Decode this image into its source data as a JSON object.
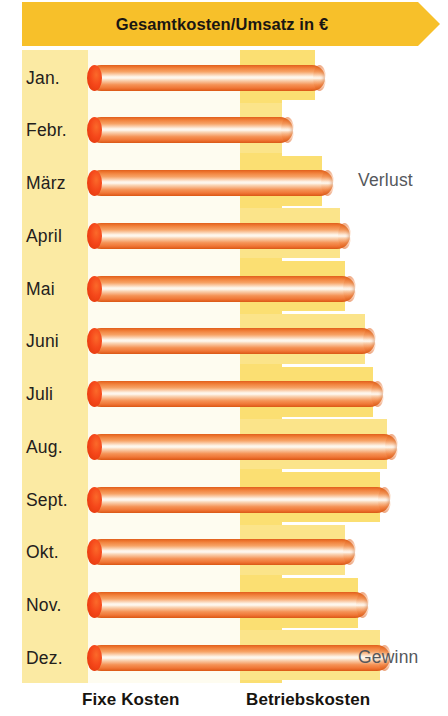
{
  "header": {
    "title": "Gesamtkosten/Umsatz in €",
    "banner_color": "#f7c02a"
  },
  "annotations": {
    "loss_label": "Verlust",
    "profit_label": "Gewinn"
  },
  "legend": {
    "fixed_costs": "Fixe Kosten",
    "operating_costs": "Betriebskosten"
  },
  "colors": {
    "banner": "#f7c02a",
    "label_band": "#fbeaa3",
    "cream": "#fefcf0",
    "operating_band": "#fbdf72",
    "bar_body": "#f59255",
    "bar_cap": "#ef4a18",
    "text": "#23201c",
    "annotation_text": "#55585c"
  },
  "chart_data": {
    "type": "bar",
    "orientation": "horizontal",
    "title": "Gesamtkosten/Umsatz in €",
    "xlabel": "",
    "ylabel": "",
    "grid": false,
    "legend_position": "bottom",
    "xlim": [
      0,
      100
    ],
    "categories": [
      "Jan.",
      "Febr.",
      "März",
      "April",
      "Mai",
      "Juni",
      "Juli",
      "Aug.",
      "Sept.",
      "Okt.",
      "Nov.",
      "Dez."
    ],
    "values": [
      68,
      58,
      70,
      76,
      78,
      85,
      88,
      92,
      90,
      78,
      82,
      90
    ],
    "series": [
      {
        "name": "Gesamtkosten/Umsatz",
        "values": [
          68,
          58,
          70,
          76,
          78,
          85,
          88,
          92,
          90,
          78,
          82,
          90
        ]
      }
    ],
    "bar_end_px": [
      325,
      293,
      333,
      350,
      355,
      375,
      383,
      397,
      390,
      355,
      368,
      390
    ],
    "band_end_px": [
      315,
      282,
      322,
      340,
      345,
      365,
      373,
      387,
      380,
      345,
      358,
      380
    ],
    "annotations": [
      {
        "text": "Verlust",
        "region": "upper-right"
      },
      {
        "text": "Gewinn",
        "region": "lower-right"
      }
    ],
    "legend_entries": [
      "Fixe Kosten",
      "Betriebskosten"
    ]
  },
  "rows": [
    {
      "label": "Jan.",
      "bar_end": 325,
      "band_end": 315
    },
    {
      "label": "Febr.",
      "bar_end": 293,
      "band_end": 282
    },
    {
      "label": "März",
      "bar_end": 333,
      "band_end": 322
    },
    {
      "label": "April",
      "bar_end": 350,
      "band_end": 340
    },
    {
      "label": "Mai",
      "bar_end": 355,
      "band_end": 345
    },
    {
      "label": "Juni",
      "bar_end": 375,
      "band_end": 365
    },
    {
      "label": "Juli",
      "bar_end": 383,
      "band_end": 373
    },
    {
      "label": "Aug.",
      "bar_end": 397,
      "band_end": 387
    },
    {
      "label": "Sept.",
      "bar_end": 390,
      "band_end": 380
    },
    {
      "label": "Okt.",
      "bar_end": 355,
      "band_end": 345
    },
    {
      "label": "Nov.",
      "bar_end": 368,
      "band_end": 358
    },
    {
      "label": "Dez.",
      "bar_end": 390,
      "band_end": 380
    }
  ]
}
